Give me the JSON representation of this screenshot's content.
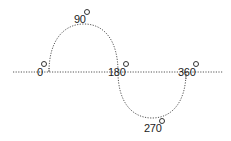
{
  "diagram": {
    "curve_color": "#555555",
    "axis_color": "#555555",
    "labels": [
      {
        "id": "deg-0",
        "text": "0",
        "angle": 0
      },
      {
        "id": "deg-90",
        "text": "90",
        "angle": 90
      },
      {
        "id": "deg-180",
        "text": "180",
        "angle": 180
      },
      {
        "id": "deg-270",
        "text": "270",
        "angle": 270
      },
      {
        "id": "deg-360",
        "text": "360",
        "angle": 360
      }
    ],
    "degree_symbol": "°"
  }
}
